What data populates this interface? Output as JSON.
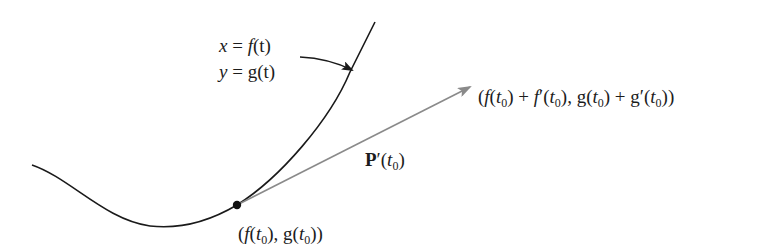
{
  "figure": {
    "type": "parametric-curve-tangent-vector",
    "colors": {
      "curve": "#1a1a1a",
      "tangent_vector": "#8a8a8a",
      "point": "#111111",
      "pointer": "#1a1a1a"
    },
    "labels": {
      "x_eq": {
        "lhs": "x",
        "eq": " = ",
        "func": "f",
        "arg": "(t)"
      },
      "y_eq": {
        "lhs": "y",
        "eq": " = ",
        "func": "g",
        "arg": "(t)"
      },
      "vector": {
        "name": "P",
        "prime": "′",
        "open": "(",
        "var": "t",
        "sub": "0",
        "close": ")"
      },
      "point": {
        "p1": "(",
        "f": "f",
        "p2": "(",
        "t": "t",
        "sub": "0",
        "p3": "), ",
        "g": "g",
        "p4": "(",
        "t2": "t",
        "sub2": "0",
        "p5": "))"
      },
      "tip": {
        "p1": "(",
        "f": "f",
        "p2": "(",
        "t": "t",
        "sub": "0",
        "p3": ") + ",
        "fp": "f",
        "prime": "′",
        "p4": "(",
        "t2": "t",
        "sub2": "0",
        "p5": "), ",
        "g": "g",
        "p6": "(",
        "t3": "t",
        "sub3": "0",
        "p7": ") + ",
        "gp": "g",
        "prime2": "′",
        "p8": "(",
        "t4": "t",
        "sub4": "0",
        "p9": "))"
      }
    }
  }
}
